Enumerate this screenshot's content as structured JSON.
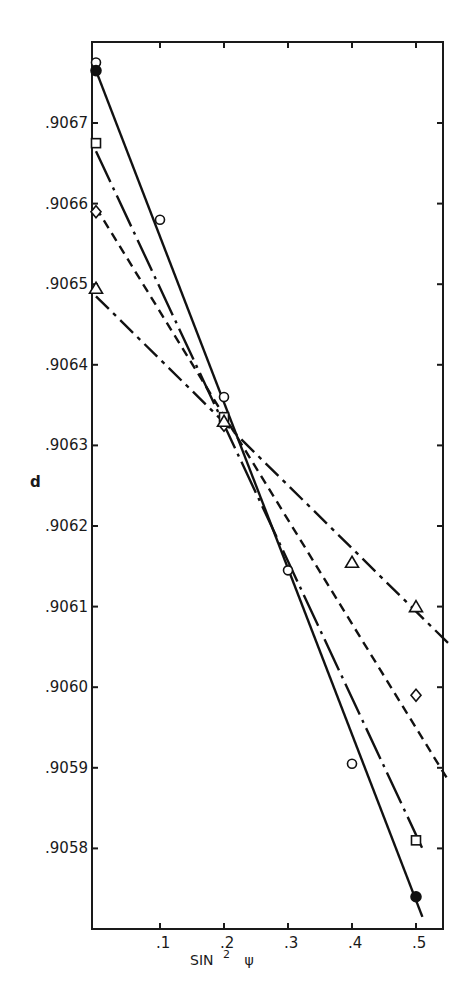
{
  "chart_data": {
    "type": "line",
    "title": "",
    "xlabel": "SIN² ψ",
    "xlabel_main": "SIN",
    "xlabel_sup": "2",
    "xlabel_sym": "ψ",
    "ylabel": "d",
    "xlim": [
      0,
      0.55
    ],
    "ylim": [
      0.90571,
      0.90679
    ],
    "grid": false,
    "legend": null,
    "x_ticks": [
      ".1",
      ".2",
      ".3",
      ".4",
      ".5"
    ],
    "y_ticks": [
      ".9067",
      ".9066",
      ".9065",
      ".9064",
      ".9063",
      ".9062",
      ".9061",
      ".9060",
      ".9059",
      ".9058"
    ],
    "series": [
      {
        "name": "solid (circles / filled circle)",
        "line_style": "solid",
        "marker": "circle",
        "fit_line": [
          [
            0.0,
            0.906765
          ],
          [
            0.51,
            0.905715
          ]
        ],
        "points": [
          {
            "x": 0.0,
            "y": 0.906775,
            "marker": "circle-open"
          },
          {
            "x": 0.0,
            "y": 0.906765,
            "marker": "circle-filled"
          },
          {
            "x": 0.1,
            "y": 0.90658,
            "marker": "circle-open"
          },
          {
            "x": 0.2,
            "y": 0.90636,
            "marker": "circle-open"
          },
          {
            "x": 0.3,
            "y": 0.906145,
            "marker": "circle-open"
          },
          {
            "x": 0.4,
            "y": 0.905905,
            "marker": "circle-open"
          },
          {
            "x": 0.5,
            "y": 0.90574,
            "marker": "circle-filled"
          }
        ]
      },
      {
        "name": "long dash-dot (squares)",
        "line_style": "long-dash-dot",
        "marker": "square",
        "fit_line": [
          [
            0.0,
            0.906665
          ],
          [
            0.51,
            0.9058
          ]
        ],
        "points": [
          {
            "x": 0.0,
            "y": 0.906675,
            "marker": "square"
          },
          {
            "x": 0.2,
            "y": 0.906335,
            "marker": "square"
          },
          {
            "x": 0.5,
            "y": 0.90581,
            "marker": "square"
          }
        ]
      },
      {
        "name": "dashed (diamonds)",
        "line_style": "dashed",
        "marker": "diamond",
        "fit_line": [
          [
            0.0,
            0.906595
          ],
          [
            0.55,
            0.905885
          ]
        ],
        "points": [
          {
            "x": 0.0,
            "y": 0.90659,
            "marker": "diamond"
          },
          {
            "x": 0.2,
            "y": 0.906325,
            "marker": "diamond"
          },
          {
            "x": 0.5,
            "y": 0.90599,
            "marker": "diamond"
          }
        ]
      },
      {
        "name": "dash-dot (triangles)",
        "line_style": "dash-dot",
        "marker": "triangle",
        "fit_line": [
          [
            0.0,
            0.906485
          ],
          [
            0.55,
            0.906055
          ]
        ],
        "points": [
          {
            "x": 0.0,
            "y": 0.906495,
            "marker": "triangle"
          },
          {
            "x": 0.2,
            "y": 0.90633,
            "marker": "triangle"
          },
          {
            "x": 0.4,
            "y": 0.906155,
            "marker": "triangle"
          },
          {
            "x": 0.5,
            "y": 0.9061,
            "marker": "triangle"
          }
        ]
      }
    ],
    "annotations": []
  }
}
